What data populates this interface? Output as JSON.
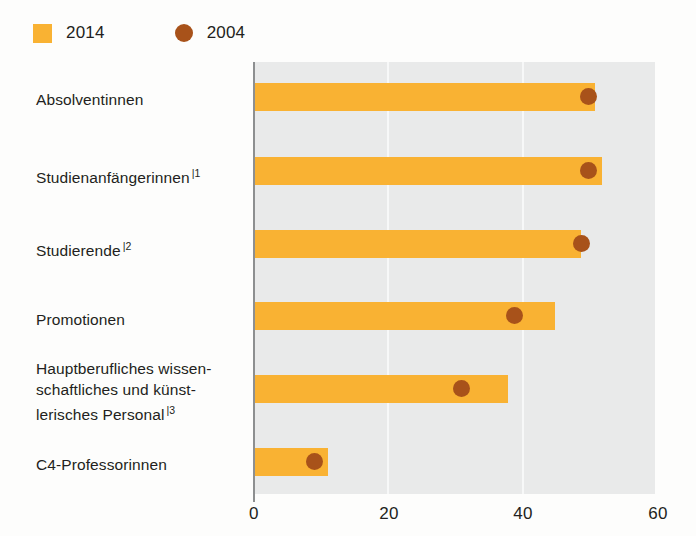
{
  "legend": {
    "entries": [
      {
        "label": "2014",
        "marker": "square-swatch-icon",
        "color": "#f9b233"
      },
      {
        "label": "2004",
        "marker": "circle-swatch-icon",
        "color": "#a8521a"
      }
    ]
  },
  "axis": {
    "x_ticks": [
      "0",
      "20",
      "40",
      "60"
    ],
    "x_tick_values": [
      0,
      20,
      40,
      60
    ]
  },
  "categories": [
    {
      "line1": "Absolventinnen",
      "line2": "",
      "line3": "",
      "footnote": ""
    },
    {
      "line1": "Studienanfängerinnen",
      "line2": "",
      "line3": "",
      "footnote": "|1"
    },
    {
      "line1": "Studierende",
      "line2": "",
      "line3": "",
      "footnote": "|2"
    },
    {
      "line1": "Promotionen",
      "line2": "",
      "line3": "",
      "footnote": ""
    },
    {
      "line1": "Hauptberufliches wissen-",
      "line2": "schaftliches und künst-",
      "line3": "lerisches Personal",
      "footnote": "|3"
    },
    {
      "line1": "C4-Professorinnen",
      "line2": "",
      "line3": "",
      "footnote": ""
    }
  ],
  "chart_data": {
    "type": "bar",
    "orientation": "horizontal",
    "title": "",
    "subtitle": "",
    "xlabel": "",
    "ylabel": "",
    "xlim": [
      0,
      60
    ],
    "grid": true,
    "legend_position": "top-left",
    "categories": [
      "Absolventinnen",
      "Studienanfängerinnen |1",
      "Studierende |2",
      "Promotionen",
      "Hauptberufliches wissenschaftliches und künstlerisches Personal |3",
      "C4-Professorinnen"
    ],
    "series": [
      {
        "name": "2014",
        "type": "bar",
        "color": "#f9b233",
        "values": [
          51,
          52,
          49,
          45,
          38,
          11
        ]
      },
      {
        "name": "2004",
        "type": "scatter",
        "color": "#a8521a",
        "values": [
          50,
          50,
          49,
          39,
          31,
          9
        ]
      }
    ]
  }
}
